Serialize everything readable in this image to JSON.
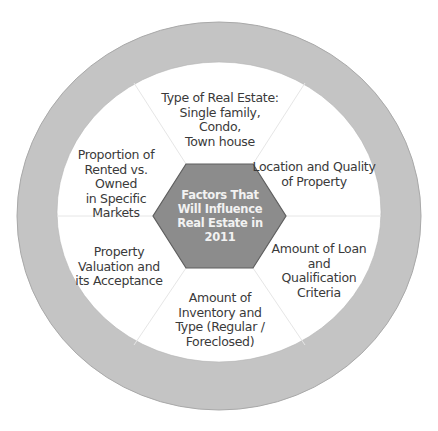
{
  "diagram": {
    "type": "radial-hexagon-cycle",
    "colors": {
      "ring": "#c4c4c4",
      "ring_edge": "#a9a9a9",
      "hexagon_fill": "#8c8c8c",
      "hexagon_border": "#5e5e5e",
      "center_text": "#f2f2f2",
      "segment_text": "#3a3a3a",
      "divider": "#e6e6e6",
      "background": "#ffffff"
    },
    "center": {
      "label": "Factors That\nWill Influence\nReal Estate in\n2011"
    },
    "segments": [
      {
        "position": "top",
        "label": "Type of Real Estate:\nSingle family, Condo,\nTown house"
      },
      {
        "position": "upper-right",
        "label": "Location and Quality\nof Property"
      },
      {
        "position": "lower-right",
        "label": "Amount of Loan\nand\nQualification\nCriteria"
      },
      {
        "position": "bottom",
        "label": "Amount of\nInventory and\nType (Regular /\nForeclosed)"
      },
      {
        "position": "lower-left",
        "label": "Property\nValuation and\nits Acceptance"
      },
      {
        "position": "upper-left",
        "label": "Proportion of\nRented vs. Owned\nin Specific Markets"
      }
    ]
  }
}
